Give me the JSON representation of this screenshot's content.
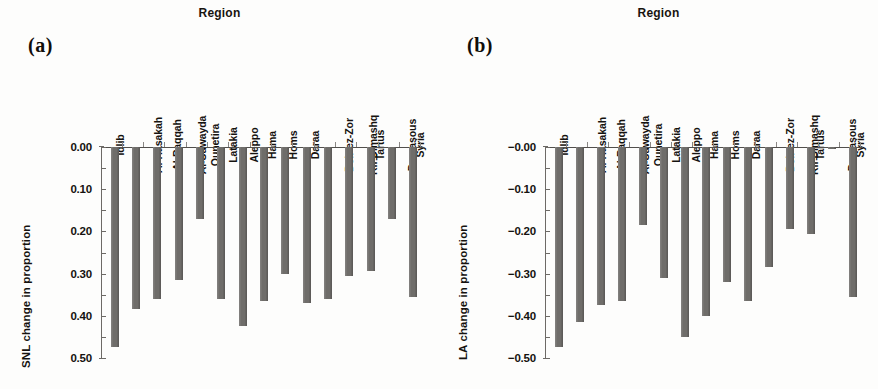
{
  "figure": {
    "panels": [
      {
        "tag": "(a)",
        "top_title": "Region",
        "ylabel": "SNL change in proportion",
        "xlabel": "Region",
        "ytick_labels": [
          "0.00",
          "0.10",
          "0.20",
          "0.30",
          "0.40",
          "0.50",
          "0.60",
          "0.70",
          "0.80",
          "0.90",
          "−1.00"
        ]
      },
      {
        "tag": "(b)",
        "top_title": "Region",
        "ylabel": "LA change in proportion",
        "xlabel": "Region",
        "ytick_labels": [
          "−0.00",
          "−0.10",
          "−0.20",
          "−0.30",
          "−0.40",
          "−0.50",
          "−0.60",
          "−0.70",
          "−0.80",
          "−0.90",
          "−1.00"
        ]
      }
    ]
  },
  "colors": {
    "bar": "#6f6d6a",
    "axis": "#6d6a66",
    "text": "#15120f",
    "background": "#fdfdfc"
  },
  "chart_data": [
    {
      "type": "bar",
      "panel": "(a)",
      "title": "Region",
      "xlabel": "Region",
      "ylabel": "SNL change in proportion",
      "ylim": [
        0.0,
        -1.0
      ],
      "yticks": [
        0.0,
        -0.1,
        -0.2,
        -0.3,
        -0.4,
        -0.5,
        -0.6,
        -0.7,
        -0.8,
        -0.9,
        -1.0
      ],
      "ytick_labels": [
        "0.00",
        "0.10",
        "0.20",
        "0.30",
        "0.40",
        "0.50",
        "0.60",
        "0.70",
        "0.80",
        "0.90",
        "−1.00"
      ],
      "axis_direction": "inverted (0 at top, -1.00 at bottom)",
      "grid": false,
      "legend": "none",
      "categories": [
        "Idlib",
        "Al-Hasakah",
        "Al-Raqqah",
        "Al-Suwayda",
        "Qunetira",
        "Latakia",
        "Aleppo",
        "Hama",
        "Homs",
        "Daraa",
        "Deir ez-Zor",
        "Rif Dimashq",
        "Tartus",
        "Damasous",
        "Syria"
      ],
      "values": [
        -0.95,
        -0.77,
        -0.72,
        -0.63,
        -0.34,
        -0.72,
        -0.85,
        -0.73,
        -0.6,
        -0.74,
        -0.72,
        -0.61,
        -0.59,
        -0.34,
        -0.71
      ]
    },
    {
      "type": "bar",
      "panel": "(b)",
      "title": "Region",
      "xlabel": "Region",
      "ylabel": "LA change in proportion",
      "ylim": [
        0.0,
        -1.0
      ],
      "yticks": [
        0.0,
        -0.1,
        -0.2,
        -0.3,
        -0.4,
        -0.5,
        -0.6,
        -0.7,
        -0.8,
        -0.9,
        -1.0
      ],
      "ytick_labels": [
        "−0.00",
        "−0.10",
        "−0.20",
        "−0.30",
        "−0.40",
        "−0.50",
        "−0.60",
        "−0.70",
        "−0.80",
        "−0.90",
        "−1.00"
      ],
      "axis_direction": "inverted (0 at top, -1.00 at bottom)",
      "grid": false,
      "legend": "none",
      "categories": [
        "Idlib",
        "Al-Hasakah",
        "Al-Raqqah",
        "Al-Suwayda",
        "Qunetira",
        "Latakia",
        "Aleppo",
        "Hama",
        "Homs",
        "Daraa",
        "Deir ez-Zor",
        "Rif Dimashq",
        "Tartus",
        "Damasous",
        "Syria"
      ],
      "values": [
        -0.95,
        -0.83,
        -0.75,
        -0.73,
        -0.37,
        -0.62,
        -0.9,
        -0.8,
        -0.64,
        -0.73,
        -0.57,
        -0.39,
        -0.41,
        -0.01,
        -0.71
      ]
    }
  ]
}
